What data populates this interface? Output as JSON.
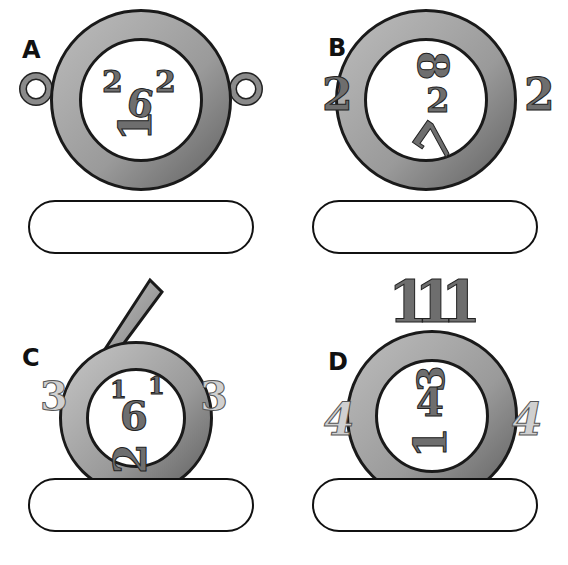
{
  "puzzles": [
    {
      "label": "A",
      "left": "O",
      "right": "O",
      "top_left": "2",
      "top_right": "2",
      "center": "6",
      "bottom": "1",
      "answer": ""
    },
    {
      "label": "B",
      "left": "2",
      "right": "2",
      "top": "8",
      "center": "2",
      "bottom": "7",
      "answer": ""
    },
    {
      "label": "C",
      "left": "3",
      "right": "3",
      "frame": "6",
      "top_left": "1",
      "top_right": "1",
      "center": "6",
      "bottom": "2",
      "answer": ""
    },
    {
      "label": "D",
      "left": "4",
      "right": "4",
      "top": "111",
      "upper": "3",
      "center": "4",
      "bottom": "1",
      "answer": ""
    }
  ],
  "colors": {
    "ring": "#9a9a9a",
    "ring_dark": "#1a1a1a",
    "answer_border": "#111111"
  }
}
